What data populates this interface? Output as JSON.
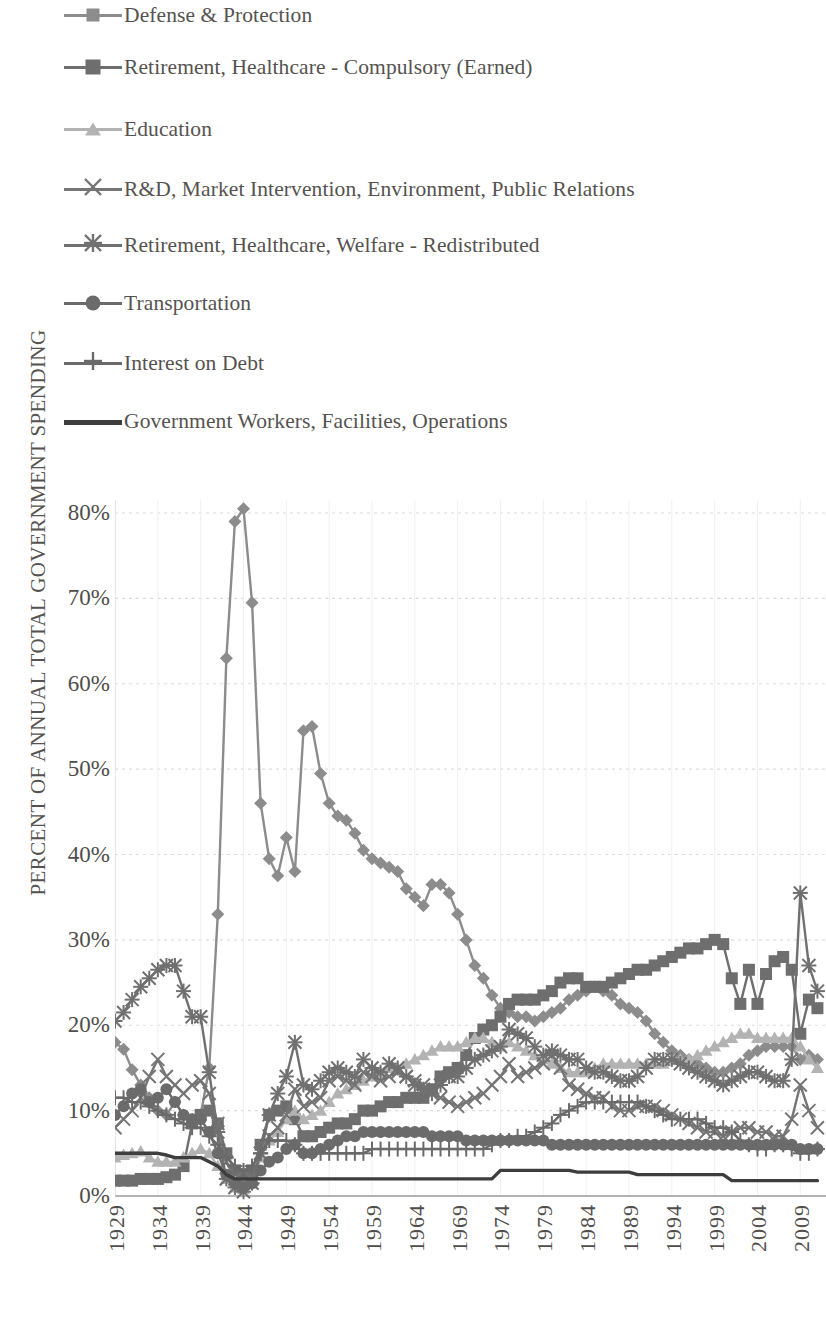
{
  "chart_data": {
    "type": "line",
    "title": "",
    "xlabel": "",
    "ylabel": "PERCENT OF ANNUAL TOTAL GOVERNMENT SPENDING",
    "ylim": [
      0,
      85
    ],
    "ytick_labels": [
      "0%",
      "10%",
      "20%",
      "30%",
      "40%",
      "50%",
      "60%",
      "70%",
      "80%"
    ],
    "ytick_values": [
      0,
      10,
      20,
      30,
      40,
      50,
      60,
      70,
      80
    ],
    "xlim": [
      1929,
      2012
    ],
    "xtick_labels": [
      "1929",
      "1934",
      "1939",
      "1944",
      "1949",
      "1954",
      "1959",
      "1964",
      "1969",
      "1974",
      "1979",
      "1984",
      "1989",
      "1994",
      "1999",
      "2004",
      "2009"
    ],
    "xtick_values": [
      1929,
      1934,
      1939,
      1944,
      1949,
      1954,
      1959,
      1964,
      1969,
      1974,
      1979,
      1984,
      1989,
      1994,
      1999,
      2004,
      2009
    ],
    "grid": true,
    "legend_position": "above-plot",
    "x": [
      1929,
      1930,
      1931,
      1932,
      1933,
      1934,
      1935,
      1936,
      1937,
      1938,
      1939,
      1940,
      1941,
      1942,
      1943,
      1944,
      1945,
      1946,
      1947,
      1948,
      1949,
      1950,
      1951,
      1952,
      1953,
      1954,
      1955,
      1956,
      1957,
      1958,
      1959,
      1960,
      1961,
      1962,
      1963,
      1964,
      1965,
      1966,
      1967,
      1968,
      1969,
      1970,
      1971,
      1972,
      1973,
      1974,
      1975,
      1976,
      1977,
      1978,
      1979,
      1980,
      1981,
      1982,
      1983,
      1984,
      1985,
      1986,
      1987,
      1988,
      1989,
      1990,
      1991,
      1992,
      1993,
      1994,
      1995,
      1996,
      1997,
      1998,
      1999,
      2000,
      2001,
      2002,
      2003,
      2004,
      2005,
      2006,
      2007,
      2008,
      2009,
      2010,
      2011
    ],
    "series": [
      {
        "name": "Defense & Protection",
        "marker": "diamond",
        "color": "#8c8c8c",
        "values": [
          18.0,
          17.2,
          14.8,
          13.0,
          11.5,
          10.0,
          9.5,
          11.0,
          9.5,
          9.0,
          9.5,
          15.0,
          33.0,
          63.0,
          79.0,
          80.5,
          69.5,
          46.0,
          39.5,
          37.5,
          42.0,
          38.0,
          54.5,
          55.0,
          49.5,
          46.0,
          44.5,
          44.0,
          42.5,
          40.5,
          39.5,
          39.0,
          38.5,
          38.0,
          36.0,
          35.0,
          34.0,
          36.5,
          36.5,
          35.5,
          33.0,
          30.0,
          27.0,
          25.5,
          23.5,
          22.0,
          21.5,
          21.0,
          21.0,
          20.5,
          21.0,
          21.5,
          22.0,
          23.0,
          23.5,
          24.0,
          24.5,
          24.0,
          23.5,
          22.5,
          22.0,
          21.5,
          20.5,
          19.0,
          18.0,
          17.0,
          16.5,
          16.0,
          15.5,
          15.0,
          14.5,
          14.5,
          15.0,
          15.5,
          16.5,
          17.0,
          17.5,
          17.5,
          17.5,
          17.5,
          16.0,
          16.5,
          16.0
        ]
      },
      {
        "name": "Retirement, Healthcare - Compulsory (Earned)",
        "marker": "square",
        "color": "#6e6e6e",
        "values": [
          1.8,
          1.8,
          1.8,
          2.0,
          2.0,
          2.0,
          2.2,
          2.5,
          3.5,
          8.5,
          9.5,
          10.0,
          8.5,
          5.0,
          3.0,
          2.5,
          3.0,
          6.0,
          9.5,
          10.0,
          10.5,
          9.0,
          7.0,
          7.0,
          7.5,
          8.0,
          8.5,
          8.5,
          9.0,
          10.0,
          10.0,
          10.5,
          11.0,
          11.0,
          11.5,
          11.5,
          11.5,
          12.5,
          14.0,
          14.5,
          15.0,
          16.5,
          18.5,
          19.5,
          20.0,
          21.0,
          22.5,
          23.0,
          23.0,
          23.0,
          23.5,
          24.0,
          25.0,
          25.5,
          25.5,
          24.5,
          24.5,
          24.5,
          25.0,
          25.5,
          26.0,
          26.5,
          26.5,
          27.0,
          27.5,
          28.0,
          28.5,
          29.0,
          29.0,
          29.5,
          30.0,
          29.5,
          25.5,
          22.5,
          26.5,
          22.5,
          26.0,
          27.5,
          28.0,
          26.5,
          19.0,
          23.0,
          22.0
        ]
      },
      {
        "name": "Education",
        "marker": "triangle",
        "color": "#b3b3b3",
        "values": [
          4.5,
          4.8,
          5.0,
          5.2,
          4.5,
          4.0,
          4.0,
          4.0,
          4.5,
          5.0,
          5.5,
          5.0,
          3.5,
          2.0,
          1.0,
          0.8,
          1.5,
          4.5,
          6.5,
          7.5,
          9.0,
          10.0,
          9.0,
          9.5,
          10.0,
          11.0,
          12.0,
          12.5,
          13.0,
          13.5,
          14.0,
          14.5,
          15.0,
          15.0,
          15.5,
          16.0,
          16.5,
          17.0,
          17.5,
          17.5,
          17.5,
          18.0,
          18.5,
          18.5,
          18.0,
          17.5,
          18.0,
          17.5,
          17.0,
          16.5,
          16.0,
          15.5,
          15.0,
          14.5,
          14.5,
          14.5,
          15.0,
          15.5,
          15.5,
          15.5,
          15.5,
          15.5,
          15.5,
          15.5,
          15.5,
          16.0,
          16.0,
          16.0,
          16.5,
          17.0,
          17.5,
          18.0,
          18.5,
          19.0,
          19.0,
          18.5,
          18.5,
          18.5,
          18.5,
          18.5,
          17.5,
          16.0,
          15.0
        ]
      },
      {
        "name": "R&D, Market Intervention, Environment, Public Relations",
        "marker": "cross",
        "color": "#757575",
        "values": [
          8.0,
          9.0,
          10.0,
          11.5,
          14.0,
          16.0,
          14.0,
          13.0,
          12.0,
          13.0,
          13.5,
          12.0,
          8.5,
          4.0,
          2.0,
          1.5,
          2.0,
          5.0,
          7.0,
          8.0,
          9.5,
          12.5,
          10.5,
          11.0,
          11.5,
          13.5,
          14.0,
          13.5,
          13.0,
          14.5,
          14.0,
          13.5,
          14.0,
          14.5,
          14.0,
          13.5,
          13.0,
          12.0,
          11.5,
          11.0,
          10.5,
          11.0,
          11.5,
          12.0,
          13.0,
          14.0,
          15.5,
          14.0,
          14.5,
          15.0,
          15.5,
          16.5,
          15.0,
          13.0,
          12.5,
          12.0,
          11.5,
          11.5,
          10.5,
          10.0,
          10.0,
          10.5,
          10.5,
          10.5,
          10.0,
          9.5,
          9.0,
          8.5,
          8.0,
          7.5,
          7.5,
          7.0,
          7.5,
          8.0,
          8.0,
          7.5,
          7.5,
          7.0,
          7.0,
          9.0,
          13.0,
          10.0,
          8.0
        ]
      },
      {
        "name": "Retirement, Healthcare, Welfare - Redistributed",
        "marker": "star",
        "color": "#707070",
        "values": [
          20.5,
          21.5,
          23.0,
          24.5,
          25.5,
          26.5,
          27.0,
          27.0,
          24.0,
          21.0,
          21.0,
          14.5,
          7.5,
          2.0,
          1.0,
          0.5,
          1.5,
          5.0,
          9.5,
          12.0,
          14.0,
          18.0,
          13.0,
          12.5,
          13.5,
          14.5,
          15.0,
          14.5,
          14.0,
          16.0,
          15.0,
          14.5,
          15.5,
          15.0,
          14.0,
          13.0,
          12.5,
          12.0,
          13.0,
          14.0,
          14.0,
          15.0,
          16.0,
          16.5,
          17.0,
          17.5,
          19.5,
          19.0,
          18.5,
          17.5,
          16.5,
          17.0,
          16.5,
          16.0,
          16.0,
          15.0,
          14.5,
          14.5,
          14.0,
          13.5,
          13.5,
          14.0,
          15.0,
          16.0,
          16.0,
          16.0,
          15.5,
          15.0,
          14.5,
          14.0,
          13.5,
          13.0,
          13.5,
          14.0,
          14.5,
          14.5,
          14.0,
          13.5,
          13.5,
          16.0,
          35.5,
          27.0,
          24.0
        ]
      },
      {
        "name": "Transportation",
        "marker": "circle",
        "color": "#6b6b6b",
        "values": [
          9.5,
          10.5,
          12.0,
          12.5,
          11.0,
          11.5,
          12.5,
          11.0,
          9.5,
          9.0,
          9.0,
          7.5,
          5.0,
          2.5,
          1.5,
          1.0,
          1.5,
          3.0,
          4.0,
          4.5,
          5.5,
          6.0,
          5.0,
          5.0,
          5.5,
          6.0,
          6.5,
          7.0,
          7.0,
          7.5,
          7.5,
          7.5,
          7.5,
          7.5,
          7.5,
          7.5,
          7.5,
          7.0,
          7.0,
          7.0,
          7.0,
          6.5,
          6.5,
          6.5,
          6.5,
          6.5,
          6.5,
          6.5,
          6.5,
          6.5,
          6.5,
          6.0,
          6.0,
          6.0,
          6.0,
          6.0,
          6.0,
          6.0,
          6.0,
          6.0,
          6.0,
          6.0,
          6.0,
          6.0,
          6.0,
          6.0,
          6.0,
          6.0,
          6.0,
          6.0,
          6.0,
          6.0,
          6.0,
          6.0,
          6.0,
          6.0,
          6.0,
          6.0,
          6.0,
          6.0,
          5.5,
          5.5,
          5.5
        ]
      },
      {
        "name": "Interest on Debt",
        "marker": "plus",
        "color": "#6a6a6a",
        "values": [
          11.5,
          11.5,
          11.0,
          11.0,
          10.5,
          10.0,
          9.5,
          9.0,
          8.5,
          8.0,
          8.0,
          7.0,
          6.0,
          4.5,
          3.5,
          3.0,
          3.5,
          5.0,
          6.5,
          6.5,
          6.5,
          6.0,
          5.0,
          5.0,
          5.0,
          5.0,
          5.0,
          5.0,
          5.0,
          5.0,
          5.5,
          5.5,
          5.5,
          5.5,
          5.5,
          5.5,
          5.5,
          5.5,
          5.5,
          5.5,
          5.5,
          5.5,
          5.5,
          5.5,
          6.0,
          6.5,
          6.5,
          7.0,
          7.0,
          7.5,
          8.0,
          8.5,
          9.5,
          10.0,
          10.5,
          11.0,
          11.0,
          11.0,
          11.0,
          11.0,
          11.0,
          11.0,
          10.5,
          10.0,
          9.5,
          9.0,
          9.0,
          9.0,
          9.0,
          8.5,
          8.0,
          8.0,
          7.5,
          6.5,
          6.0,
          5.5,
          5.5,
          6.0,
          6.0,
          5.5,
          5.0,
          5.0,
          5.5
        ]
      },
      {
        "name": "Government Workers, Facilities, Operations",
        "marker": "none",
        "color": "#3d3d3d",
        "values": [
          5.0,
          5.0,
          5.0,
          5.0,
          5.0,
          5.0,
          4.8,
          4.5,
          4.5,
          4.5,
          4.5,
          4.0,
          3.5,
          2.5,
          2.0,
          2.0,
          2.0,
          2.0,
          2.0,
          2.0,
          2.0,
          2.0,
          2.0,
          2.0,
          2.0,
          2.0,
          2.0,
          2.0,
          2.0,
          2.0,
          2.0,
          2.0,
          2.0,
          2.0,
          2.0,
          2.0,
          2.0,
          2.0,
          2.0,
          2.0,
          2.0,
          2.0,
          2.0,
          2.0,
          2.0,
          3.0,
          3.0,
          3.0,
          3.0,
          3.0,
          3.0,
          3.0,
          3.0,
          3.0,
          2.8,
          2.8,
          2.8,
          2.8,
          2.8,
          2.8,
          2.8,
          2.5,
          2.5,
          2.5,
          2.5,
          2.5,
          2.5,
          2.5,
          2.5,
          2.5,
          2.5,
          2.5,
          1.8,
          1.8,
          1.8,
          1.8,
          1.8,
          1.8,
          1.8,
          1.8,
          1.8,
          1.8,
          1.8
        ]
      }
    ]
  },
  "legend": {
    "items": [
      {
        "label": "Defense & Protection",
        "marker": "diamond",
        "color": "#8c8c8c"
      },
      {
        "label": "Retirement, Healthcare - Compulsory (Earned)",
        "marker": "square",
        "color": "#6e6e6e"
      },
      {
        "label": "Education",
        "marker": "triangle",
        "color": "#b3b3b3"
      },
      {
        "label": "R&D, Market Intervention, Environment, Public Relations",
        "marker": "cross",
        "color": "#757575"
      },
      {
        "label": "Retirement, Healthcare, Welfare - Redistributed",
        "marker": "star",
        "color": "#707070"
      },
      {
        "label": "Transportation",
        "marker": "circle",
        "color": "#6b6b6b"
      },
      {
        "label": "Interest on Debt",
        "marker": "plus",
        "color": "#6a6a6a"
      },
      {
        "label": "Government Workers, Facilities, Operations",
        "marker": "none",
        "color": "#3d3d3d"
      }
    ]
  },
  "colors": {
    "grid": "#dcdcdc",
    "text": "#55524f",
    "background": "#ffffff"
  }
}
